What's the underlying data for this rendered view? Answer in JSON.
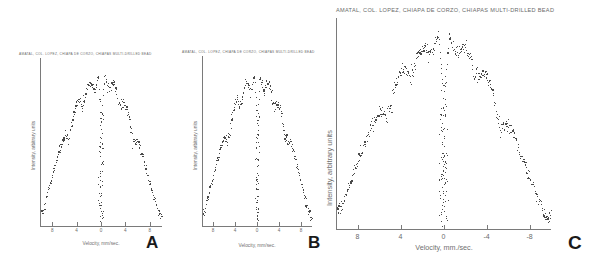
{
  "figure": {
    "panel_count": 3,
    "background": "#ffffff",
    "ink_color": "#4a4a4a"
  },
  "panels": [
    {
      "letter": "A",
      "title": "AMATAL, COL. LOPEZ, CHIAPA DE CORZO, CHIAPAS MULTI-DRILLED BEAD",
      "xlabel": "Velocity, mm/sec.",
      "ylabel": "Intensity, arbitrary units",
      "xticks": [
        "8",
        "4",
        "0",
        "4",
        "8"
      ]
    },
    {
      "letter": "B",
      "title": "AMATAL, COL. LOPEZ, CHIAPA DE CORZO, CHIAPAS MULTI-DRILLED BEAD",
      "xlabel": "Velocity, mm/sec.",
      "ylabel": "Intensity, arbitrary units",
      "xticks": [
        "8",
        "4",
        "0",
        "4",
        "8"
      ]
    },
    {
      "letter": "C",
      "title": "AMATAL, COL. LOPEZ, CHIAPA DE CORZO, CHIAPAS  MULTI-DRILLED BEAD",
      "xlabel": "Velocity, mm./sec.",
      "ylabel": "Intensity, arbitrary units",
      "xticks": [
        "8",
        "4",
        "0",
        "-4",
        "-8"
      ]
    }
  ],
  "chart_data": [
    {
      "type": "scatter",
      "panel": "A",
      "title": "AMATAL, COL. LOPEZ, CHIAPA DE CORZO, CHIAPAS MULTI-DRILLED BEAD",
      "xlabel": "Velocity, mm/sec.",
      "ylabel": "Intensity, arbitrary units",
      "xlim": [
        10,
        -10
      ],
      "ylim": [
        0,
        1
      ],
      "xticks": [
        8,
        4,
        0,
        -4,
        -8
      ],
      "xtick_labels": [
        "8",
        "4",
        "0",
        "4",
        "8"
      ],
      "grid": false,
      "legend": false,
      "description": "Mossbauer transmission spectrum: broad inverted-parabola absorption envelope with a deep narrow central dip near zero velocity; noisy point cloud.",
      "envelope_x": [
        -9.5,
        -8.5,
        -7.5,
        -6.5,
        -5.5,
        -4.5,
        -3.5,
        -2.5,
        -1.5,
        -0.5,
        0.0,
        0.5,
        1.5,
        2.5,
        3.5,
        4.5,
        5.5,
        6.5,
        7.5,
        8.5,
        9.5
      ],
      "envelope_y": [
        0.08,
        0.2,
        0.33,
        0.46,
        0.58,
        0.68,
        0.76,
        0.83,
        0.88,
        0.9,
        0.62,
        0.9,
        0.88,
        0.84,
        0.78,
        0.7,
        0.61,
        0.5,
        0.38,
        0.25,
        0.1
      ],
      "central_dip_x": 0.0,
      "central_dip_depth": 0.92,
      "point_count": 260,
      "scatter_sigma": 0.035
    },
    {
      "type": "scatter",
      "panel": "B",
      "title": "AMATAL, COL. LOPEZ, CHIAPA DE CORZO, CHIAPAS MULTI-DRILLED BEAD",
      "xlabel": "Velocity, mm/sec.",
      "ylabel": "Intensity, arbitrary units",
      "xlim": [
        10,
        -10
      ],
      "ylim": [
        0,
        1
      ],
      "xticks": [
        8,
        4,
        0,
        -4,
        -8
      ],
      "xtick_labels": [
        "8",
        "4",
        "0",
        "4",
        "8"
      ],
      "grid": false,
      "legend": false,
      "description": "Mossbauer transmission spectrum, same specimen, second run: inverted-parabola envelope with deep narrow central absorption line.",
      "envelope_x": [
        -9.5,
        -8.5,
        -7.5,
        -6.5,
        -5.5,
        -4.5,
        -3.5,
        -2.5,
        -1.5,
        -0.5,
        0.0,
        0.5,
        1.5,
        2.5,
        3.5,
        4.5,
        5.5,
        6.5,
        7.5,
        8.5,
        9.5
      ],
      "envelope_y": [
        0.07,
        0.19,
        0.32,
        0.45,
        0.57,
        0.67,
        0.75,
        0.82,
        0.87,
        0.89,
        0.6,
        0.89,
        0.87,
        0.83,
        0.77,
        0.69,
        0.6,
        0.49,
        0.37,
        0.24,
        0.09
      ],
      "central_dip_x": 0.0,
      "central_dip_depth": 0.93,
      "point_count": 260,
      "scatter_sigma": 0.035
    },
    {
      "type": "scatter",
      "panel": "C",
      "title": "AMATAL, COL. LOPEZ, CHIAPA DE CORZO, CHIAPAS  MULTI-DRILLED BEAD",
      "xlabel": "Velocity, mm./sec.",
      "ylabel": "Intensity, arbitrary units",
      "xlim": [
        10,
        -10
      ],
      "ylim": [
        0,
        1
      ],
      "xticks": [
        8,
        4,
        0,
        -4,
        -8
      ],
      "xtick_labels": [
        "8",
        "4",
        "0",
        "-4",
        "-8"
      ],
      "grid": false,
      "legend": false,
      "description": "Enlarged Mossbauer transmission spectrum: broad inverted-parabola absorption envelope with a deep narrow central dip at zero velocity; dense noisy point cloud.",
      "envelope_x": [
        -9.5,
        -8.5,
        -7.5,
        -6.5,
        -5.5,
        -4.5,
        -3.5,
        -2.5,
        -1.5,
        -0.5,
        0.0,
        0.5,
        1.5,
        2.5,
        3.5,
        4.5,
        5.5,
        6.5,
        7.5,
        8.5,
        9.5
      ],
      "envelope_y": [
        0.06,
        0.18,
        0.31,
        0.45,
        0.57,
        0.68,
        0.77,
        0.84,
        0.89,
        0.92,
        0.63,
        0.92,
        0.89,
        0.85,
        0.79,
        0.71,
        0.62,
        0.51,
        0.39,
        0.26,
        0.11
      ],
      "central_dip_x": 0.0,
      "central_dip_depth": 0.95,
      "point_count": 420,
      "scatter_sigma": 0.04
    }
  ]
}
